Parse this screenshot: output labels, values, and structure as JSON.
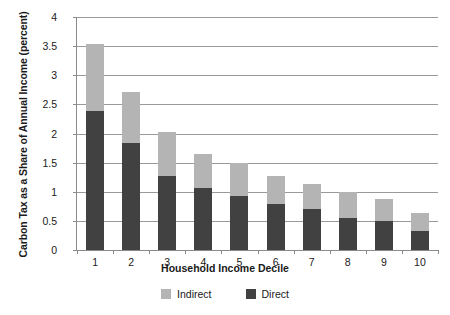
{
  "chart_data": {
    "type": "bar",
    "stacked": true,
    "title": "",
    "xlabel": "Household Income Decile",
    "ylabel": "Carbon Tax as a Share of Annual Income (percent)",
    "categories": [
      "1",
      "2",
      "3",
      "4",
      "5",
      "6",
      "7",
      "8",
      "9",
      "10"
    ],
    "series": [
      {
        "name": "Direct",
        "color": "#414141",
        "values": [
          2.38,
          1.83,
          1.27,
          1.06,
          0.93,
          0.79,
          0.7,
          0.55,
          0.5,
          0.33
        ]
      },
      {
        "name": "Indirect",
        "color": "#b4b4b4",
        "values": [
          1.15,
          0.89,
          0.75,
          0.59,
          0.57,
          0.48,
          0.43,
          0.44,
          0.38,
          0.3
        ]
      }
    ],
    "totals": [
      3.53,
      2.72,
      2.02,
      1.65,
      1.5,
      1.27,
      1.13,
      0.99,
      0.88,
      0.63
    ],
    "ylim": [
      0,
      4
    ],
    "yticks": [
      "0",
      "0.5",
      "1",
      "1.5",
      "2",
      "2.5",
      "3",
      "3.5",
      "4"
    ],
    "ytick_values": [
      0,
      0.5,
      1,
      1.5,
      2,
      2.5,
      3,
      3.5,
      4
    ],
    "grid": true,
    "legend_position": "bottom",
    "legend": [
      {
        "label": "Indirect",
        "color": "#b4b4b4"
      },
      {
        "label": "Direct",
        "color": "#414141"
      }
    ]
  }
}
